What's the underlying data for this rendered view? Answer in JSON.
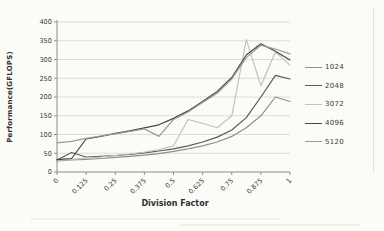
{
  "chart_data": {
    "type": "line",
    "title": "",
    "xlabel": "Division Factor",
    "ylabel": "Performance(GFLOPS)",
    "x_tick_labels": [
      "0",
      "0.125",
      "0.25",
      "0.375",
      "0.5",
      "0.625",
      "0.75",
      "0.875",
      "1"
    ],
    "y_ticks": [
      0,
      50,
      100,
      150,
      200,
      250,
      300,
      350,
      400
    ],
    "xlim": [
      0,
      1
    ],
    "ylim": [
      0,
      400
    ],
    "grid": "horizontal",
    "legend_position": "right",
    "x": [
      0,
      0.0625,
      0.125,
      0.1875,
      0.25,
      0.3125,
      0.375,
      0.4375,
      0.5,
      0.5625,
      0.625,
      0.6875,
      0.75,
      0.8125,
      0.875,
      0.9375,
      1
    ],
    "series": [
      {
        "name": "1024",
        "color": "#8f8f8f",
        "values": [
          30,
          32,
          34,
          36,
          39,
          42,
          45,
          49,
          55,
          62,
          70,
          80,
          95,
          118,
          150,
          200,
          188
        ]
      },
      {
        "name": "2048",
        "color": "#5a5a5a",
        "values": [
          32,
          52,
          40,
          42,
          44,
          47,
          51,
          56,
          62,
          70,
          80,
          93,
          112,
          145,
          200,
          258,
          248
        ]
      },
      {
        "name": "3072",
        "color": "#c2c2c2",
        "values": [
          31,
          34,
          37,
          40,
          44,
          48,
          53,
          60,
          70,
          140,
          130,
          118,
          150,
          353,
          230,
          320,
          285
        ]
      },
      {
        "name": "4096",
        "color": "#454545",
        "values": [
          33,
          36,
          88,
          95,
          103,
          110,
          118,
          126,
          143,
          163,
          188,
          215,
          252,
          312,
          342,
          322,
          299
        ]
      },
      {
        "name": "5120",
        "color": "#9b9b9b",
        "values": [
          78,
          82,
          90,
          96,
          102,
          108,
          115,
          95,
          140,
          160,
          185,
          210,
          248,
          305,
          338,
          328,
          315
        ]
      }
    ]
  }
}
